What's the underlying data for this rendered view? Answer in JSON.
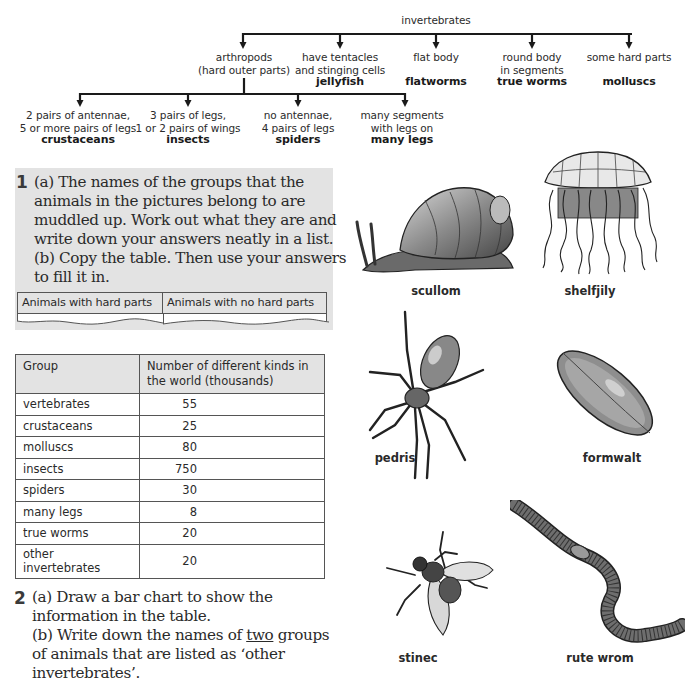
{
  "tree": {
    "root": "invertebrates",
    "level1": [
      {
        "desc": [
          "arthropods",
          "(hard outer parts)"
        ],
        "name": ""
      },
      {
        "desc": [
          "have tentacles",
          "and stinging cells"
        ],
        "name": "jellyfish"
      },
      {
        "desc": [
          "flat body",
          ""
        ],
        "name": "flatworms"
      },
      {
        "desc": [
          "round body",
          "in segments"
        ],
        "name": "true worms"
      },
      {
        "desc": [
          "some hard parts",
          ""
        ],
        "name": "molluscs"
      }
    ],
    "arthropods": [
      {
        "desc": [
          "2 pairs of antennae,",
          "5 or more pairs of legs"
        ],
        "name": "crustaceans"
      },
      {
        "desc": [
          "3 pairs of legs,",
          "1 or 2 pairs of wings"
        ],
        "name": "insects"
      },
      {
        "desc": [
          "no antennae,",
          "4 pairs of legs"
        ],
        "name": "spiders"
      },
      {
        "desc": [
          "many segments",
          "with legs on"
        ],
        "name": "many legs"
      }
    ]
  },
  "question1": {
    "number": "1",
    "lines": [
      "(a)  The names of the groups that the",
      "animals in the pictures belong to are",
      "muddled up. Work out what they are and",
      "write down your answers neatly in a list.",
      "(b)  Copy the table. Then use your answers",
      "to fill it in."
    ],
    "table_headers": [
      "Animals with hard parts",
      "Animals with no hard parts"
    ]
  },
  "data_table": {
    "headers": [
      "Group",
      "Number of different kinds in the world (thousands)"
    ],
    "header_lines": [
      "Number of different kinds in",
      "the world (thousands)"
    ],
    "rows": [
      {
        "group": "vertebrates",
        "value": "55"
      },
      {
        "group": "crustaceans",
        "value": "25"
      },
      {
        "group": "molluscs",
        "value": "80"
      },
      {
        "group": "insects",
        "value": "750"
      },
      {
        "group": "spiders",
        "value": "30"
      },
      {
        "group": "many legs",
        "value": "8"
      },
      {
        "group": "true worms",
        "value": "20"
      },
      {
        "group": "other invertebrates",
        "group_lines": [
          "other",
          "invertebrates"
        ],
        "value": "20"
      }
    ]
  },
  "question2": {
    "number": "2",
    "lines": [
      "(a)  Draw a bar chart to show the",
      "information in the table.",
      "(b)  Write down the names of ",
      "of animals that are listed as ‘other",
      "invertebrates’."
    ],
    "underlined_word": "two",
    "after_underline": " groups"
  },
  "animals": [
    {
      "label": "scullom",
      "depicts": "snail"
    },
    {
      "label": "shelfjily",
      "depicts": "jellyfish"
    },
    {
      "label": "pedris",
      "depicts": "spider"
    },
    {
      "label": "formwalt",
      "depicts": "flatworm"
    },
    {
      "label": "stinec",
      "depicts": "insect (fly)"
    },
    {
      "label": "rute wrom",
      "depicts": "earthworm"
    }
  ],
  "colors": {
    "box_grey": "#e3e3e3",
    "text": "#231f20",
    "lines": "#1a1a1a"
  }
}
